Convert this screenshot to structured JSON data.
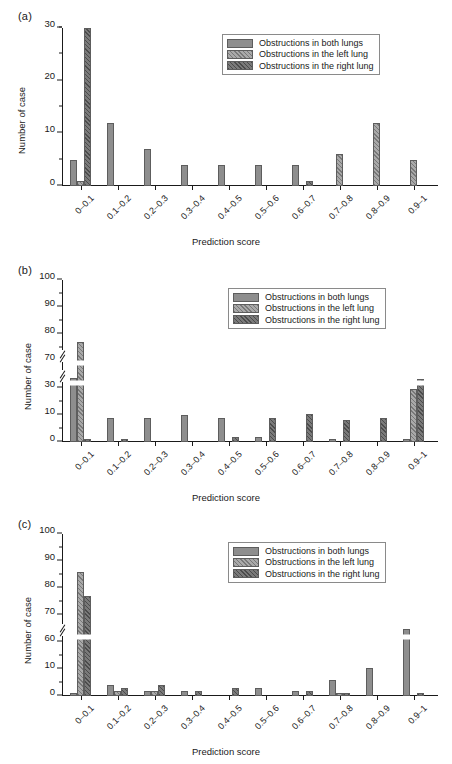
{
  "figure": {
    "series_labels": {
      "both": "Obstructions in both lungs",
      "left": "Obstructions in the left lung",
      "right": "Obstructions in the right lung"
    },
    "colors": {
      "both": "#8e8e8e",
      "left": "#a9a9a9",
      "right": "#7a7a7a",
      "axis": "#1a1a1a",
      "bar_border": "#5d5d5d",
      "background": "#ffffff"
    },
    "categories": [
      "0–0.1",
      "0.1–0.2",
      "0.2–0.3",
      "0.3–0.4",
      "0.4–0.5",
      "0.5–0.6",
      "0.6–0.7",
      "0.7–0.8",
      "0.8–0.9",
      "0.9–1"
    ],
    "xlabel": "Prediction score",
    "ylabel": "Number of case"
  },
  "panels": [
    {
      "key": "a",
      "label": "(a)",
      "chart_data": {
        "type": "bar",
        "title": "",
        "xlabel": "Prediction score",
        "ylabel": "Number of case",
        "categories": [
          "0–0.1",
          "0.1–0.2",
          "0.2–0.3",
          "0.3–0.4",
          "0.4–0.5",
          "0.5–0.6",
          "0.6–0.7",
          "0.7–0.8",
          "0.8–0.9",
          "0.9–1"
        ],
        "series": [
          {
            "name": "Obstructions in both lungs",
            "key": "both",
            "values": [
              5,
              12,
              7,
              4,
              4,
              4,
              4,
              0,
              0,
              0
            ]
          },
          {
            "name": "Obstructions in the left lung",
            "key": "left",
            "values": [
              1,
              0,
              0,
              0,
              0,
              0,
              0,
              6,
              12,
              5
            ]
          },
          {
            "name": "Obstructions in the right lung",
            "key": "right",
            "values": [
              31,
              0,
              0,
              0,
              0,
              0,
              1,
              0,
              0,
              0
            ]
          }
        ],
        "ylim": [
          0,
          35
        ],
        "yticks": [
          0,
          10,
          20,
          30
        ],
        "yticks_minor": [
          5,
          15,
          25,
          35
        ],
        "ytick_labels": [
          "0",
          "10",
          "20",
          "30"
        ],
        "axis_break": false,
        "grid": false,
        "legend_position": "top-right"
      }
    },
    {
      "key": "b",
      "label": "(b)",
      "chart_data": {
        "type": "bar",
        "title": "",
        "xlabel": "Prediction score",
        "ylabel": "Number of case",
        "categories": [
          "0–0.1",
          "0.1–0.2",
          "0.2–0.3",
          "0.3–0.4",
          "0.4–0.5",
          "0.5–0.6",
          "0.6–0.7",
          "0.7–0.8",
          "0.8–0.9",
          "0.9–1"
        ],
        "series": [
          {
            "name": "Obstructions in both lungs",
            "key": "both",
            "values": [
              45,
              9,
              9,
              10,
              9,
              2,
              0,
              1,
              0,
              1
            ]
          },
          {
            "name": "Obstructions in the left lung",
            "key": "left",
            "values": [
              77,
              0,
              0,
              0,
              0,
              0,
              0,
              0,
              0,
              29
            ]
          },
          {
            "name": "Obstructions in the right lung",
            "key": "right",
            "values": [
              1,
              1,
              0,
              0,
              2,
              9,
              11,
              8,
              9,
              44
            ]
          }
        ],
        "ylim": [
          0,
          100
        ],
        "yticks": [
          0,
          10,
          30,
          70,
          80,
          90,
          100
        ],
        "ytick_labels": [
          "0",
          "10",
          "30",
          "70",
          "80",
          "90",
          "100"
        ],
        "axis_break": true,
        "axis_break_between": [
          10,
          30
        ],
        "axis_break_second": 60,
        "grid": false,
        "legend_position": "top-right"
      }
    },
    {
      "key": "c",
      "label": "(c)",
      "chart_data": {
        "type": "bar",
        "title": "",
        "xlabel": "Prediction score",
        "ylabel": "Number of case",
        "categories": [
          "0–0.1",
          "0.1–0.2",
          "0.2–0.3",
          "0.3–0.4",
          "0.4–0.5",
          "0.5–0.6",
          "0.6–0.7",
          "0.7–0.8",
          "0.8–0.9",
          "0.9–1"
        ],
        "series": [
          {
            "name": "Obstructions in both lungs",
            "key": "both",
            "values": [
              1,
              4,
              2,
              2,
              0,
              3,
              2,
              6,
              12,
              65
            ]
          },
          {
            "name": "Obstructions in the left lung",
            "key": "left",
            "values": [
              86,
              2,
              2,
              0,
              0,
              0,
              0,
              1,
              0,
              0
            ]
          },
          {
            "name": "Obstructions in the right lung",
            "key": "right",
            "values": [
              77,
              3,
              4,
              2,
              3,
              0,
              2,
              1,
              0,
              1
            ]
          }
        ],
        "ylim": [
          0,
          100
        ],
        "yticks": [
          0,
          10,
          60,
          70,
          80,
          90,
          100
        ],
        "ytick_labels": [
          "0",
          "10",
          "60",
          "70",
          "80",
          "90",
          "100"
        ],
        "axis_break": true,
        "axis_break_between": [
          10,
          60
        ],
        "grid": false,
        "legend_position": "top-right"
      }
    }
  ]
}
